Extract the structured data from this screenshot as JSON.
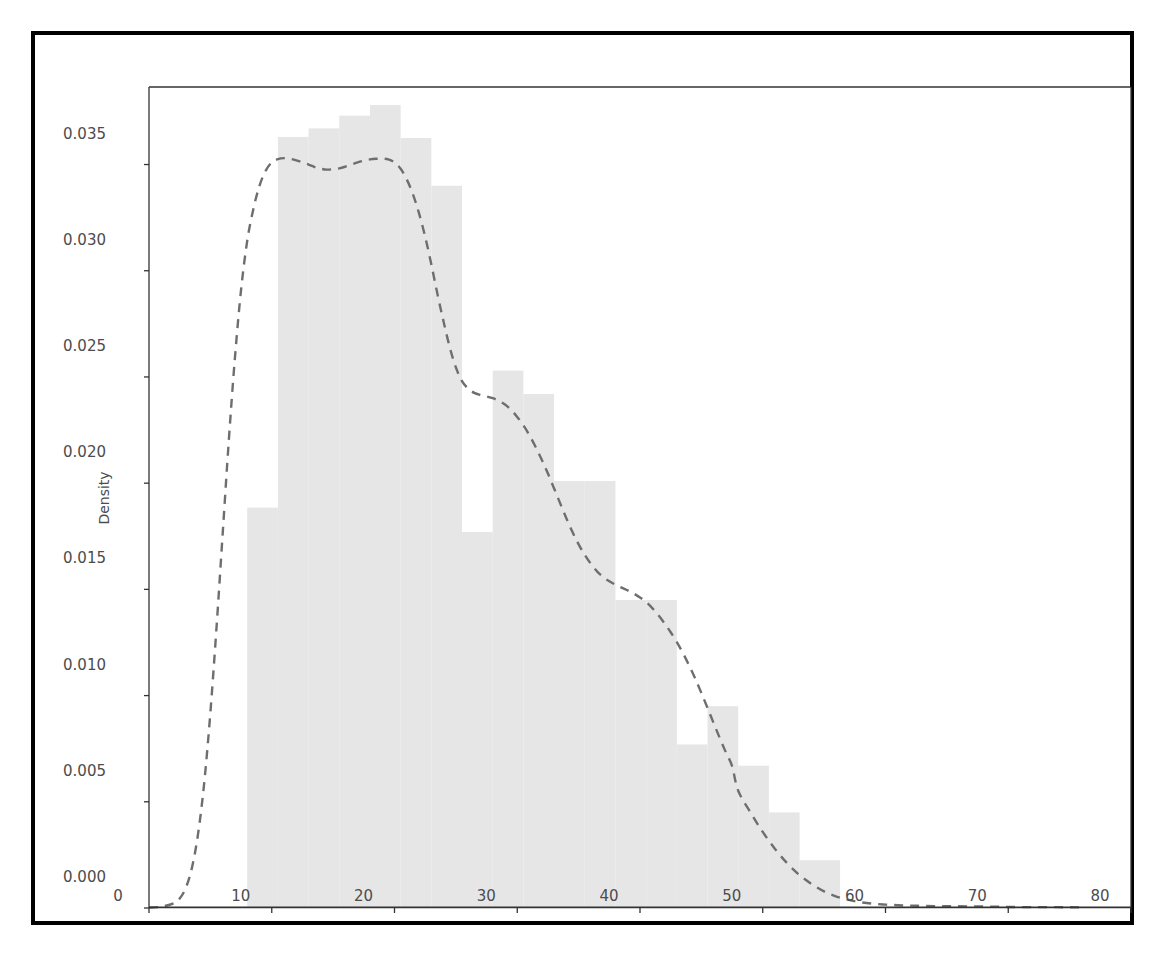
{
  "figure": {
    "background_color": "#ffffff",
    "frame_color": "#000000",
    "axes_color": "#333333"
  },
  "chart_data": {
    "type": "histogram",
    "title": "",
    "subtitle": "",
    "xlabel": "",
    "ylabel": "Density",
    "xlim": [
      0,
      80
    ],
    "ylim": [
      0.0,
      0.03865
    ],
    "grid": false,
    "legend": null,
    "xticks": [
      0,
      10,
      20,
      30,
      40,
      50,
      60,
      70,
      80
    ],
    "xtick_labels": [
      "0",
      "10",
      "20",
      "30",
      "40",
      "50",
      "60",
      "70",
      "80"
    ],
    "yticks": [
      0.0,
      0.005,
      0.01,
      0.015,
      0.02,
      0.025,
      0.03,
      0.035
    ],
    "ytick_labels": [
      "0.000",
      "0.005",
      "0.010",
      "0.015",
      "0.020",
      "0.025",
      "0.030",
      "0.035"
    ],
    "bar_fill_color": "#e6e6e6",
    "bar_edge_color": "#e6e6e6",
    "kde_line_color": "#6e6e6e",
    "kde_line_style": "dashed",
    "kde_line_width": 2.4,
    "bin_edges": [
      8.0,
      10.5,
      13.0,
      15.5,
      18.0,
      20.5,
      23.0,
      25.5,
      28.0,
      30.5,
      33.0,
      35.5,
      38.0,
      40.5,
      43.0,
      45.5,
      48.0,
      50.5,
      53.0,
      56.3
    ],
    "bin_densities": [
      0.01885,
      0.0363,
      0.0367,
      0.0373,
      0.0378,
      0.03625,
      0.034,
      0.0177,
      0.0253,
      0.0242,
      0.0201,
      0.0201,
      0.0145,
      0.0145,
      0.0077,
      0.0095,
      0.0067,
      0.0045,
      0.00225
    ],
    "kde_x": [
      0.0,
      1.0,
      2.0,
      2.5,
      3.0,
      3.5,
      4.0,
      4.5,
      5.0,
      5.5,
      6.0,
      6.5,
      7.0,
      7.5,
      8.0,
      8.5,
      9.0,
      9.5,
      10.0,
      10.5,
      11.0,
      11.5,
      12.0,
      12.5,
      13.0,
      13.5,
      14.0,
      14.5,
      15.0,
      15.5,
      16.0,
      16.5,
      17.0,
      17.5,
      18.0,
      18.5,
      19.0,
      19.5,
      20.0,
      20.5,
      21.0,
      21.5,
      22.0,
      22.5,
      23.0,
      23.5,
      24.0,
      24.5,
      25.0,
      25.5,
      26.0,
      26.5,
      27.0,
      27.5,
      28.0,
      28.5,
      29.0,
      29.5,
      30.0,
      30.5,
      31.0,
      31.5,
      32.0,
      32.5,
      33.0,
      33.5,
      34.0,
      34.5,
      35.0,
      35.5,
      36.0,
      36.5,
      37.0,
      37.5,
      38.0,
      38.5,
      39.0,
      39.5,
      40.0,
      40.5,
      41.0,
      41.5,
      42.0,
      42.5,
      43.0,
      43.5,
      44.0,
      44.5,
      45.0,
      45.5,
      46.0,
      46.5,
      47.0,
      47.5,
      48.0,
      49.0,
      50.0,
      51.0,
      52.0,
      53.0,
      54.0,
      55.0,
      56.0,
      57.0,
      58.0,
      59.0,
      60.0,
      61.0,
      62.0,
      63.0,
      64.0,
      65.0,
      66.0,
      67.0,
      68.0,
      69.0,
      70.0,
      72.0,
      74.0,
      76.0,
      78.0,
      80.0
    ],
    "kde_y": [
      2e-05,
      6e-05,
      0.00022,
      0.00045,
      0.00095,
      0.0019,
      0.0035,
      0.0059,
      0.0092,
      0.0132,
      0.0176,
      0.022,
      0.0259,
      0.0291,
      0.0314,
      0.0329,
      0.034,
      0.0347,
      0.0351,
      0.03525,
      0.0353,
      0.03527,
      0.0352,
      0.0351,
      0.035,
      0.03488,
      0.0348,
      0.03476,
      0.03478,
      0.03482,
      0.0349,
      0.035,
      0.0351,
      0.03518,
      0.03524,
      0.03527,
      0.03528,
      0.03524,
      0.0351,
      0.0348,
      0.0343,
      0.0336,
      0.0327,
      0.0316,
      0.0303,
      0.0289,
      0.0276,
      0.0264,
      0.02545,
      0.0248,
      0.02445,
      0.02425,
      0.02415,
      0.02408,
      0.024,
      0.02388,
      0.0237,
      0.02345,
      0.02312,
      0.02272,
      0.02225,
      0.0217,
      0.0211,
      0.02045,
      0.01975,
      0.01905,
      0.01835,
      0.0177,
      0.01712,
      0.01662,
      0.0162,
      0.01585,
      0.01558,
      0.01538,
      0.01522,
      0.01508,
      0.01495,
      0.0148,
      0.01462,
      0.0144,
      0.01412,
      0.01378,
      0.0134,
      0.01298,
      0.01252,
      0.012,
      0.01142,
      0.0108,
      0.01012,
      0.00942,
      0.0087,
      0.008,
      0.00732,
      0.00668,
      0.00552,
      0.0045,
      0.00358,
      0.00278,
      0.0021,
      0.00155,
      0.00112,
      0.00078,
      0.00054,
      0.00038,
      0.00027,
      0.0002,
      0.00016,
      0.00013,
      0.00011,
      0.0001,
      9e-05,
      8e-05,
      8e-05,
      7e-05,
      7e-05,
      6e-05,
      5e-05,
      4e-05,
      4e-05,
      3e-05,
      3e-05
    ]
  }
}
